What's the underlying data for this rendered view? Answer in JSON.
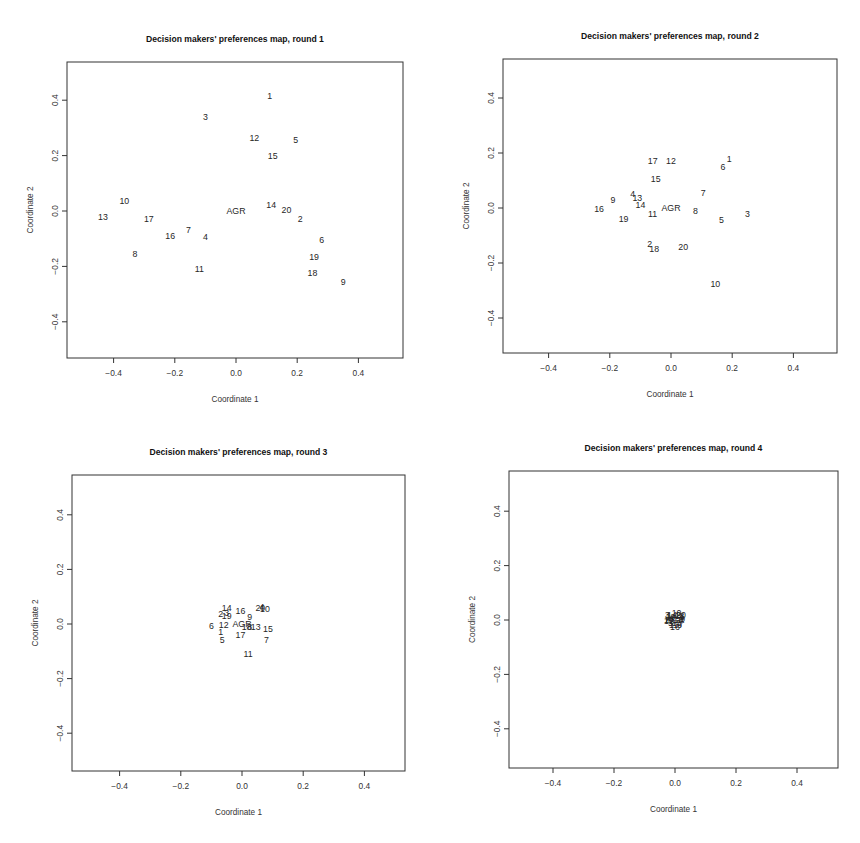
{
  "figure": {
    "panels": [
      {
        "id": "round1",
        "title": "Decision makers' preferences map, round  1",
        "xlabel": "Coordinate 1",
        "ylabel": "Coordinate 2"
      },
      {
        "id": "round2",
        "title": "Decision makers' preferences map, round  2",
        "xlabel": "Coordinate 1",
        "ylabel": "Coordinate 2"
      },
      {
        "id": "round3",
        "title": "Decision makers' preferences map, round  3",
        "xlabel": "Coordinate 1",
        "ylabel": "Coordinate 2"
      },
      {
        "id": "round4",
        "title": "Decision makers' preferences map, round  4",
        "xlabel": "Coordinate 1",
        "ylabel": "Coordinate 2"
      }
    ]
  },
  "chart_data": [
    {
      "type": "scatter",
      "title": "Decision makers' preferences map, round  1",
      "xlabel": "Coordinate 1",
      "ylabel": "Coordinate 2",
      "xlim": [
        -0.53,
        0.55
      ],
      "ylim": [
        -0.53,
        0.55
      ],
      "xticks": [
        -0.4,
        -0.2,
        0.0,
        0.2,
        0.4
      ],
      "yticks": [
        -0.4,
        -0.2,
        0.0,
        0.2,
        0.4
      ],
      "xtick_labels": [
        "-0.4",
        "-0.2",
        "0.0",
        "0.2",
        "0.4"
      ],
      "ytick_labels": [
        "-0.4",
        "-0.2",
        "0.0",
        "0.2",
        "0.4"
      ],
      "grid": false,
      "points": [
        {
          "label": "1",
          "x": 0.11,
          "y": 0.415
        },
        {
          "label": "3",
          "x": -0.1,
          "y": 0.34
        },
        {
          "label": "12",
          "x": 0.06,
          "y": 0.265
        },
        {
          "label": "5",
          "x": 0.195,
          "y": 0.255
        },
        {
          "label": "15",
          "x": 0.12,
          "y": 0.2
        },
        {
          "label": "10",
          "x": -0.365,
          "y": 0.035
        },
        {
          "label": "14",
          "x": 0.115,
          "y": 0.02
        },
        {
          "label": "20",
          "x": 0.165,
          "y": 0.005
        },
        {
          "label": "AGR",
          "x": 0.0,
          "y": 0.0
        },
        {
          "label": "13",
          "x": -0.435,
          "y": -0.02
        },
        {
          "label": "17",
          "x": -0.285,
          "y": -0.03
        },
        {
          "label": "2",
          "x": 0.21,
          "y": -0.03
        },
        {
          "label": "7",
          "x": -0.155,
          "y": -0.07
        },
        {
          "label": "16",
          "x": -0.215,
          "y": -0.09
        },
        {
          "label": "4",
          "x": -0.1,
          "y": -0.095
        },
        {
          "label": "6",
          "x": 0.28,
          "y": -0.105
        },
        {
          "label": "8",
          "x": -0.33,
          "y": -0.155
        },
        {
          "label": "19",
          "x": 0.255,
          "y": -0.165
        },
        {
          "label": "11",
          "x": -0.12,
          "y": -0.21
        },
        {
          "label": "18",
          "x": 0.25,
          "y": -0.225
        },
        {
          "label": "9",
          "x": 0.35,
          "y": -0.255
        }
      ]
    },
    {
      "type": "scatter",
      "title": "Decision makers' preferences map, round  2",
      "xlabel": "Coordinate 1",
      "ylabel": "Coordinate 2",
      "xlim": [
        -0.53,
        0.55
      ],
      "ylim": [
        -0.53,
        0.55
      ],
      "xticks": [
        -0.4,
        -0.2,
        0.0,
        0.2,
        0.4
      ],
      "yticks": [
        -0.4,
        -0.2,
        0.0,
        0.2,
        0.4
      ],
      "xtick_labels": [
        "-0.4",
        "-0.2",
        "0.0",
        "0.2",
        "0.4"
      ],
      "ytick_labels": [
        "-0.4",
        "-0.2",
        "0.0",
        "0.2",
        "0.4"
      ],
      "grid": false,
      "points": [
        {
          "label": "17",
          "x": -0.06,
          "y": 0.17
        },
        {
          "label": "12",
          "x": 0.0,
          "y": 0.17
        },
        {
          "label": "6",
          "x": 0.17,
          "y": 0.15
        },
        {
          "label": "1",
          "x": 0.19,
          "y": 0.18
        },
        {
          "label": "15",
          "x": -0.05,
          "y": 0.105
        },
        {
          "label": "7",
          "x": 0.105,
          "y": 0.055
        },
        {
          "label": "4",
          "x": -0.125,
          "y": 0.05
        },
        {
          "label": "13",
          "x": -0.11,
          "y": 0.035
        },
        {
          "label": "9",
          "x": -0.19,
          "y": 0.03
        },
        {
          "label": "14",
          "x": -0.1,
          "y": 0.01
        },
        {
          "label": "AGR",
          "x": 0.0,
          "y": 0.0
        },
        {
          "label": "16",
          "x": -0.235,
          "y": -0.005
        },
        {
          "label": "8",
          "x": 0.08,
          "y": -0.01
        },
        {
          "label": "11",
          "x": -0.06,
          "y": -0.02
        },
        {
          "label": "3",
          "x": 0.25,
          "y": -0.02
        },
        {
          "label": "19",
          "x": -0.155,
          "y": -0.04
        },
        {
          "label": "5",
          "x": 0.165,
          "y": -0.045
        },
        {
          "label": "2",
          "x": -0.07,
          "y": -0.13
        },
        {
          "label": "18",
          "x": -0.055,
          "y": -0.15
        },
        {
          "label": "20",
          "x": 0.04,
          "y": -0.14
        },
        {
          "label": "10",
          "x": 0.145,
          "y": -0.275
        }
      ]
    },
    {
      "type": "scatter",
      "title": "Decision makers' preferences map, round  3",
      "xlabel": "Coordinate 1",
      "ylabel": "Coordinate 2",
      "xlim": [
        -0.53,
        0.55
      ],
      "ylim": [
        -0.53,
        0.55
      ],
      "xticks": [
        -0.4,
        -0.2,
        0.0,
        0.2,
        0.4
      ],
      "yticks": [
        -0.4,
        -0.2,
        0.0,
        0.2,
        0.4
      ],
      "xtick_labels": [
        "-0.4",
        "-0.2",
        "0.0",
        "0.2",
        "0.4"
      ],
      "ytick_labels": [
        "-0.4",
        "-0.2",
        "0.0",
        "0.2",
        "0.4"
      ],
      "grid": false,
      "points": [
        {
          "label": "14",
          "x": -0.05,
          "y": 0.06
        },
        {
          "label": "2",
          "x": -0.07,
          "y": 0.035
        },
        {
          "label": "19",
          "x": -0.05,
          "y": 0.03
        },
        {
          "label": "3",
          "x": -0.05,
          "y": 0.04
        },
        {
          "label": "16",
          "x": -0.005,
          "y": 0.047
        },
        {
          "label": "20",
          "x": 0.06,
          "y": 0.06
        },
        {
          "label": "4",
          "x": 0.065,
          "y": 0.062
        },
        {
          "label": "10",
          "x": 0.075,
          "y": 0.055
        },
        {
          "label": "9",
          "x": 0.025,
          "y": 0.025
        },
        {
          "label": "6",
          "x": -0.1,
          "y": -0.007
        },
        {
          "label": "12",
          "x": -0.06,
          "y": -0.003
        },
        {
          "label": "AGR",
          "x": 0.0,
          "y": 0.0
        },
        {
          "label": "18",
          "x": 0.015,
          "y": -0.012
        },
        {
          "label": "8",
          "x": 0.025,
          "y": -0.01
        },
        {
          "label": "13",
          "x": 0.045,
          "y": -0.01
        },
        {
          "label": "15",
          "x": 0.085,
          "y": -0.02
        },
        {
          "label": "1",
          "x": -0.07,
          "y": -0.03
        },
        {
          "label": "5",
          "x": -0.065,
          "y": -0.06
        },
        {
          "label": "17",
          "x": -0.005,
          "y": -0.04
        },
        {
          "label": "7",
          "x": 0.08,
          "y": -0.06
        },
        {
          "label": "11",
          "x": 0.02,
          "y": -0.11
        }
      ]
    },
    {
      "type": "scatter",
      "title": "Decision makers' preferences map, round  4",
      "xlabel": "Coordinate 1",
      "ylabel": "Coordinate 2",
      "xlim": [
        -0.53,
        0.55
      ],
      "ylim": [
        -0.53,
        0.55
      ],
      "xticks": [
        -0.4,
        -0.2,
        0.0,
        0.2,
        0.4
      ],
      "yticks": [
        -0.4,
        -0.2,
        0.0,
        0.2,
        0.4
      ],
      "xtick_labels": [
        "-0.4",
        "-0.2",
        "0.0",
        "0.2",
        "0.4"
      ],
      "ytick_labels": [
        "-0.4",
        "-0.2",
        "0.0",
        "0.2",
        "0.4"
      ],
      "grid": false,
      "note": "All 20 decision makers and AGR collapse into an overlapping cluster around (0,0); individual labels illegible.",
      "points": [
        {
          "label": "AGR",
          "x": 0.0,
          "y": 0.0
        },
        {
          "label": "1",
          "x": -0.02,
          "y": 0.015
        },
        {
          "label": "2",
          "x": 0.01,
          "y": 0.02
        },
        {
          "label": "3",
          "x": -0.025,
          "y": 0.02
        },
        {
          "label": "4",
          "x": 0.02,
          "y": 0.01
        },
        {
          "label": "5",
          "x": -0.015,
          "y": -0.01
        },
        {
          "label": "6",
          "x": 0.015,
          "y": -0.02
        },
        {
          "label": "7",
          "x": 0.02,
          "y": -0.015
        },
        {
          "label": "8",
          "x": -0.01,
          "y": 0.005
        },
        {
          "label": "9",
          "x": 0.025,
          "y": 0.005
        },
        {
          "label": "10",
          "x": 0.005,
          "y": 0.025
        },
        {
          "label": "11",
          "x": -0.005,
          "y": -0.02
        },
        {
          "label": "12",
          "x": -0.02,
          "y": -0.005
        },
        {
          "label": "13",
          "x": 0.01,
          "y": 0.0
        },
        {
          "label": "14",
          "x": -0.01,
          "y": 0.02
        },
        {
          "label": "15",
          "x": 0.005,
          "y": -0.01
        },
        {
          "label": "16",
          "x": 0.0,
          "y": -0.025
        },
        {
          "label": "17",
          "x": -0.02,
          "y": 0.0
        },
        {
          "label": "18",
          "x": 0.015,
          "y": 0.015
        },
        {
          "label": "19",
          "x": -0.015,
          "y": 0.01
        },
        {
          "label": "20",
          "x": 0.02,
          "y": 0.02
        }
      ]
    }
  ]
}
